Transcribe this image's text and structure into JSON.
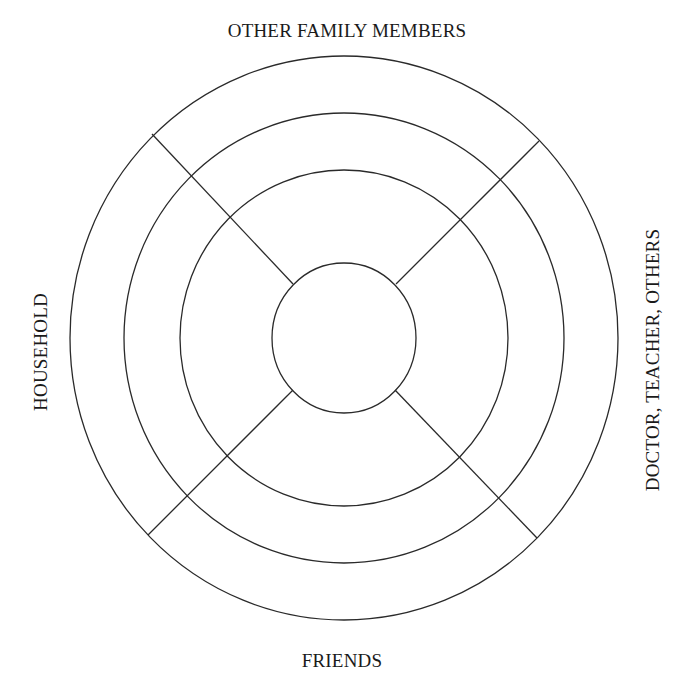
{
  "diagram": {
    "type": "concentric-circle-support-map",
    "labels": {
      "top": "OTHER FAMILY MEMBERS",
      "bottom": "FRIENDS",
      "left": "HOUSEHOLD",
      "right": "DOCTOR, TEACHER, OTHERS"
    },
    "center": {
      "x": 344,
      "y": 338
    },
    "rings": [
      {
        "name": "inner",
        "rx": 72,
        "ry": 75
      },
      {
        "name": "ring-3",
        "rx": 164,
        "ry": 168
      },
      {
        "name": "ring-2",
        "rx": 220,
        "ry": 225
      },
      {
        "name": "outer",
        "rx": 274,
        "ry": 282
      }
    ],
    "spokes": [
      {
        "name": "top-left",
        "x1": 293,
        "y1": 284,
        "x2": 152,
        "y2": 134
      },
      {
        "name": "top-right",
        "x1": 396,
        "y1": 284,
        "x2": 539,
        "y2": 141
      },
      {
        "name": "bottom-left",
        "x1": 293,
        "y1": 390,
        "x2": 148,
        "y2": 535
      },
      {
        "name": "bottom-right",
        "x1": 395,
        "y1": 390,
        "x2": 537,
        "y2": 538
      }
    ],
    "stroke_color": "#2a2a2a",
    "background_color": "#ffffff"
  }
}
